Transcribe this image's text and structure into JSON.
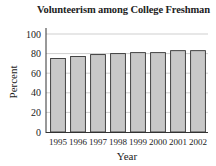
{
  "chart_data": {
    "type": "bar",
    "title": "Volunteerism among College Freshman",
    "xlabel": "Year",
    "ylabel": "Percent",
    "categories": [
      "1995",
      "1996",
      "1997",
      "1998",
      "1999",
      "2000",
      "2001",
      "2002"
    ],
    "values": [
      75,
      77,
      79,
      80,
      81,
      81,
      83,
      83
    ],
    "ylim": [
      0,
      100
    ],
    "yticks": [
      0,
      20,
      40,
      60,
      80,
      100
    ],
    "grid": true,
    "legend": null,
    "bar_color": "#c8c8c8",
    "bar_edge_color": "#333333"
  }
}
